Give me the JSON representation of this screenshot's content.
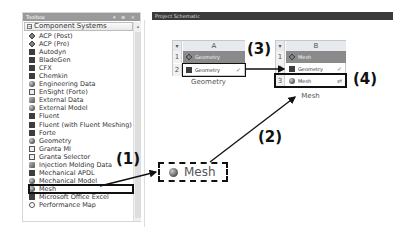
{
  "toolbox": {
    "title": "Toolbox",
    "header_controls": "▾ ⊕ ×",
    "group_title": "Component Systems",
    "group_toggle": "−",
    "scroll_up": "▴",
    "items": [
      {
        "label": "ACP (Post)",
        "icon": "acp-icon"
      },
      {
        "label": "ACP (Pre)",
        "icon": "acp-icon"
      },
      {
        "label": "Autodyn",
        "icon": "autodyn-icon"
      },
      {
        "label": "BladeGen",
        "icon": "bladegen-icon"
      },
      {
        "label": "CFX",
        "icon": "cfx-icon"
      },
      {
        "label": "Chemkin",
        "icon": "chemkin-icon"
      },
      {
        "label": "Engineering Data",
        "icon": "engineering-data-icon"
      },
      {
        "label": "EnSight (Forte)",
        "icon": "ensight-icon"
      },
      {
        "label": "External Data",
        "icon": "external-data-icon"
      },
      {
        "label": "External Model",
        "icon": "external-model-icon"
      },
      {
        "label": "Fluent",
        "icon": "fluent-icon"
      },
      {
        "label": "Fluent (with Fluent Meshing)",
        "icon": "fluent-icon"
      },
      {
        "label": "Forte",
        "icon": "forte-icon"
      },
      {
        "label": "Geometry",
        "icon": "geometry-icon"
      },
      {
        "label": "Granta MI",
        "icon": "granta-icon"
      },
      {
        "label": "Granta Selector",
        "icon": "granta-icon"
      },
      {
        "label": "Injection Molding Data",
        "icon": "injection-molding-icon"
      },
      {
        "label": "Mechanical APDL",
        "icon": "mechanical-apdl-icon"
      },
      {
        "label": "Mechanical Model",
        "icon": "mechanical-model-icon"
      },
      {
        "label": "Mesh",
        "icon": "mesh-icon",
        "selected": true
      },
      {
        "label": "Microsoft Office Excel",
        "icon": "excel-icon"
      },
      {
        "label": "Performance Map",
        "icon": "performance-map-icon"
      }
    ]
  },
  "schematic": {
    "title": "Project Schematic",
    "systems": [
      {
        "column": "A",
        "label": "Geometry",
        "rows": [
          {
            "num": "1",
            "text": "Geometry",
            "status": ""
          },
          {
            "num": "2",
            "text": "Geometry",
            "status": "✓"
          }
        ]
      },
      {
        "column": "B",
        "label": "Mesh",
        "rows": [
          {
            "num": "1",
            "text": "Mesh",
            "status": ""
          },
          {
            "num": "2",
            "text": "Geometry",
            "status": "✓"
          },
          {
            "num": "3",
            "text": "Mesh",
            "status": "⇄"
          }
        ]
      }
    ],
    "drag_preview_label": "Mesh"
  },
  "annotations": {
    "a1": "(1)",
    "a2": "(2)",
    "a3": "(3)",
    "a4": "(4)"
  },
  "colors": {
    "toolbox_header": "#9a9a9a",
    "schematic_header": "#3a3a3a",
    "system_title_row": "#8a8a8a",
    "annotation": "#111111"
  }
}
